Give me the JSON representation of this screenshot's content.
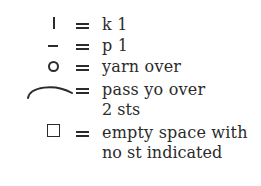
{
  "legend": {
    "items": [
      {
        "symbol": "knit-bar",
        "glyph": "|",
        "equals": "=",
        "label": "k 1"
      },
      {
        "symbol": "purl-dash",
        "glyph": "–",
        "equals": "=",
        "label": "p 1"
      },
      {
        "symbol": "yarn-over-circle",
        "glyph": "o",
        "equals": "=",
        "label": "yarn over"
      },
      {
        "symbol": "pass-yo-over-arc",
        "glyph": "⌒",
        "equals": "=",
        "label": "pass yo over",
        "label_cont": "2 sts"
      },
      {
        "symbol": "empty-square",
        "glyph": "□",
        "equals": "=",
        "label": "empty space with",
        "label_cont": "no st indicated"
      }
    ]
  }
}
